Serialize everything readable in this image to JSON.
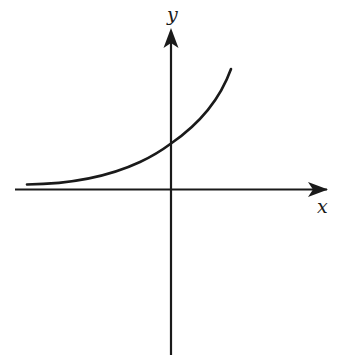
{
  "diagram": {
    "type": "function-graph",
    "axes": {
      "x_label": "x",
      "y_label": "y"
    },
    "curve": {
      "kind": "exponential",
      "behavior": "approaches x-axis asymptotically on left, crosses positive y-axis, increases steeply to the right"
    },
    "colors": {
      "stroke": "#1a1a1a",
      "background": "#ffffff"
    }
  }
}
